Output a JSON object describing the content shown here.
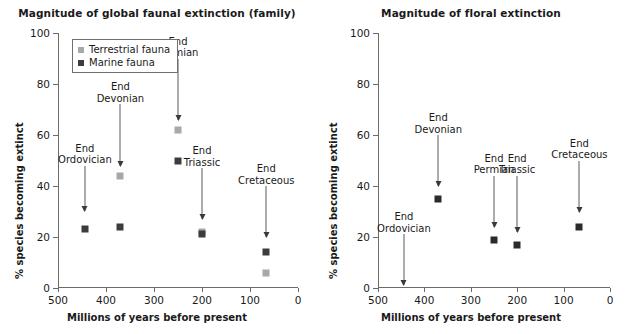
{
  "figure": {
    "xlabel": "Millions of years before present",
    "ylabel": "% species becoming extinct"
  },
  "chart_data": [
    {
      "type": "scatter",
      "title": "Magnitude of global faunal extinction (family)",
      "xlabel": "Millions of years before present",
      "ylabel": "% species becoming extinct",
      "xlim": [
        500,
        0
      ],
      "ylim": [
        0,
        100
      ],
      "x_ticks": [
        500,
        400,
        300,
        200,
        100,
        0
      ],
      "y_ticks": [
        0,
        20,
        40,
        60,
        80,
        100
      ],
      "x_reversed": true,
      "grid": false,
      "legend_position": "top-left",
      "legend": [
        {
          "name": "Terrestrial fauna",
          "color": "#a8a8a8"
        },
        {
          "name": "Marine fauna",
          "color": "#3c3c3c"
        }
      ],
      "series": [
        {
          "name": "Terrestrial fauna",
          "color": "#a8a8a8",
          "points": [
            {
              "event": "End Devonian",
              "x": 370,
              "y": 44
            },
            {
              "event": "End Permian",
              "x": 250,
              "y": 62
            },
            {
              "event": "End Triassic",
              "x": 200,
              "y": 22
            },
            {
              "event": "End Cretaceous",
              "x": 66,
              "y": 6
            }
          ]
        },
        {
          "name": "Marine fauna",
          "color": "#3c3c3c",
          "points": [
            {
              "event": "End Ordovician",
              "x": 444,
              "y": 23
            },
            {
              "event": "End Devonian",
              "x": 370,
              "y": 24
            },
            {
              "event": "End Permian",
              "x": 250,
              "y": 50
            },
            {
              "event": "End Triassic",
              "x": 200,
              "y": 21
            },
            {
              "event": "End Cretaceous",
              "x": 66,
              "y": 14
            }
          ]
        }
      ],
      "annotations": [
        {
          "label_line1": "End",
          "label_line2": "Ordovician",
          "x": 444,
          "label_y": 48,
          "arrow_to_y": 30
        },
        {
          "label_line1": "End",
          "label_line2": "Devonian",
          "x": 370,
          "label_y": 72,
          "arrow_to_y": 48
        },
        {
          "label_line1": "End",
          "label_line2": "Permian",
          "x": 250,
          "label_y": 90,
          "arrow_to_y": 66
        },
        {
          "label_line1": "End",
          "label_line2": "Triassic",
          "x": 200,
          "label_y": 47,
          "arrow_to_y": 27
        },
        {
          "label_line1": "End",
          "label_line2": "Cretaceous",
          "x": 66,
          "label_y": 40,
          "arrow_to_y": 20
        }
      ]
    },
    {
      "type": "scatter",
      "title": "Magnitude of floral extinction",
      "xlabel": "Millions of years before present",
      "ylabel": "% species becoming extinct",
      "xlim": [
        500,
        0
      ],
      "ylim": [
        0,
        100
      ],
      "x_ticks": [
        500,
        400,
        300,
        200,
        100,
        0
      ],
      "y_ticks": [
        0,
        20,
        40,
        60,
        80,
        100
      ],
      "x_reversed": true,
      "grid": false,
      "legend_position": "none",
      "legend": [],
      "series": [
        {
          "name": "Floral extinction",
          "color": "#2b2b2b",
          "points": [
            {
              "event": "End Devonian",
              "x": 370,
              "y": 35
            },
            {
              "event": "End Permian",
              "x": 250,
              "y": 19
            },
            {
              "event": "End Triassic",
              "x": 200,
              "y": 17
            },
            {
              "event": "End Cretaceous",
              "x": 66,
              "y": 24
            }
          ]
        }
      ],
      "annotations": [
        {
          "label_line1": "End",
          "label_line2": "Ordovician",
          "x": 444,
          "label_y": 21,
          "arrow_to_y": 1
        },
        {
          "label_line1": "End",
          "label_line2": "Devonian",
          "x": 370,
          "label_y": 60,
          "arrow_to_y": 40
        },
        {
          "label_line1": "End",
          "label_line2": "Permian",
          "x": 250,
          "label_y": 44,
          "arrow_to_y": 24
        },
        {
          "label_line1": "End",
          "label_line2": "Triassic",
          "x": 200,
          "label_y": 44,
          "arrow_to_y": 22
        },
        {
          "label_line1": "End",
          "label_line2": "Cretaceous",
          "x": 66,
          "label_y": 50,
          "arrow_to_y": 30
        }
      ]
    }
  ]
}
